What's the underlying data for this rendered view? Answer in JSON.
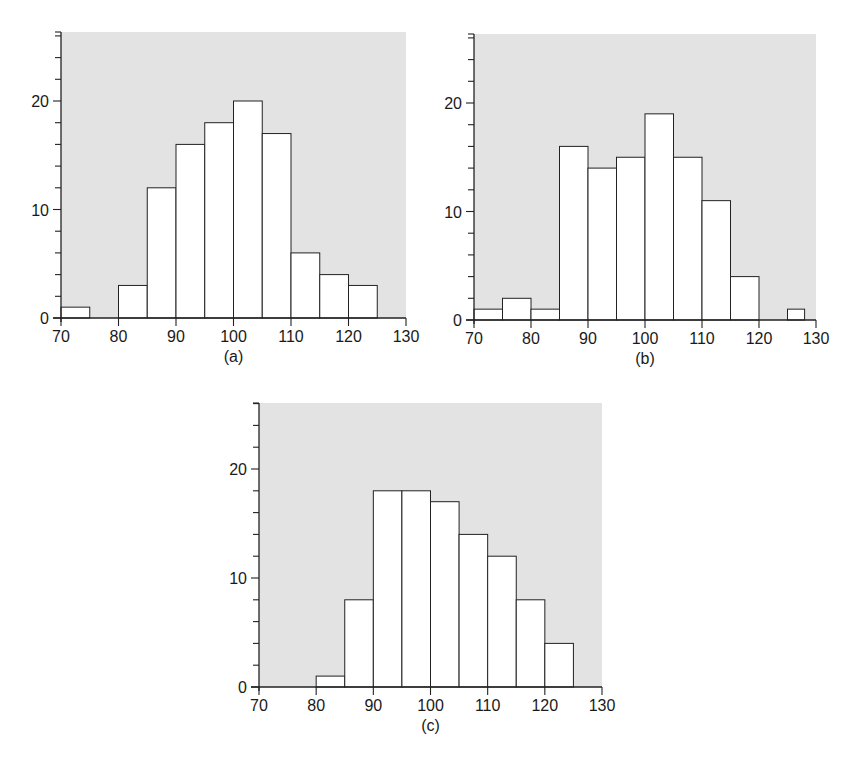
{
  "chart_data": [
    {
      "type": "bar",
      "subtype": "histogram",
      "caption": "(a)",
      "bin_edges": [
        70,
        75,
        80,
        85,
        90,
        95,
        100,
        105,
        110,
        115,
        120,
        125
      ],
      "categories": [
        "70-75",
        "75-80",
        "80-85",
        "85-90",
        "90-95",
        "95-100",
        "100-105",
        "105-110",
        "110-115",
        "115-120",
        "120-125"
      ],
      "values": [
        1,
        0,
        3,
        12,
        16,
        18,
        20,
        17,
        6,
        4,
        3
      ],
      "xlim": [
        70,
        130
      ],
      "ylim": [
        0,
        26
      ],
      "xticks": [
        "70",
        "80",
        "90",
        "100",
        "110",
        "120",
        "130"
      ],
      "yticks": [
        "0",
        "10",
        "20"
      ],
      "xlabel": "",
      "ylabel": "",
      "title": "",
      "grid": false,
      "background": "#e3e3e3",
      "geom": {
        "x0": 61,
        "x1": 406,
        "y0": 318,
        "y20": 101,
        "top": 32
      }
    },
    {
      "type": "bar",
      "subtype": "histogram",
      "caption": "(b)",
      "bin_edges": [
        70,
        75,
        80,
        85,
        90,
        95,
        100,
        105,
        110,
        115,
        120,
        125,
        128
      ],
      "categories": [
        "70-75",
        "75-80",
        "80-85",
        "85-90",
        "90-95",
        "95-100",
        "100-105",
        "105-110",
        "110-115",
        "115-120",
        "120-125",
        "125-128"
      ],
      "values": [
        1,
        2,
        1,
        16,
        14,
        15,
        19,
        15,
        11,
        4,
        0,
        1
      ],
      "xlim": [
        70,
        130
      ],
      "ylim": [
        0,
        26
      ],
      "xticks": [
        "70",
        "80",
        "90",
        "100",
        "110",
        "120",
        "130"
      ],
      "yticks": [
        "0",
        "10",
        "20"
      ],
      "xlabel": "",
      "ylabel": "",
      "title": "",
      "grid": false,
      "background": "#e3e3e3",
      "geom": {
        "x0": 474,
        "x1": 816,
        "y0": 320,
        "y20": 103,
        "top": 34
      }
    },
    {
      "type": "bar",
      "subtype": "histogram",
      "caption": "(c)",
      "bin_edges": [
        80,
        85,
        90,
        95,
        100,
        105,
        110,
        115,
        120,
        125
      ],
      "categories": [
        "80-85",
        "85-90",
        "90-95",
        "95-100",
        "100-105",
        "105-110",
        "110-115",
        "115-120",
        "120-125"
      ],
      "values": [
        1,
        8,
        18,
        18,
        17,
        14,
        12,
        8,
        4
      ],
      "xlim": [
        70,
        130
      ],
      "ylim": [
        0,
        26
      ],
      "xticks": [
        "70",
        "80",
        "90",
        "100",
        "110",
        "120",
        "130"
      ],
      "yticks": [
        "0",
        "10",
        "20"
      ],
      "xlabel": "",
      "ylabel": "",
      "title": "",
      "grid": false,
      "background": "#e3e3e3",
      "geom": {
        "x0": 259,
        "x1": 602,
        "y0": 687,
        "y20": 469,
        "top": 403
      }
    }
  ]
}
